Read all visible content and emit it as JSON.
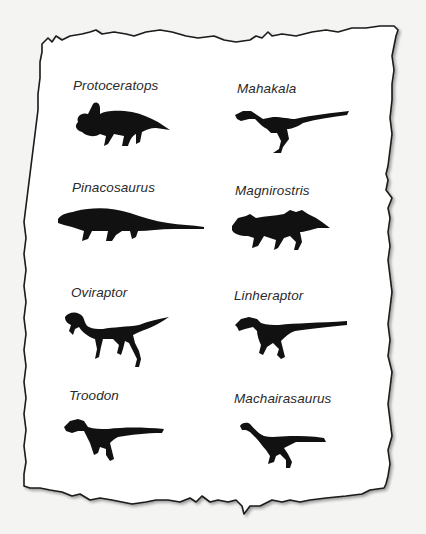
{
  "panel": {
    "background": "#f4f4f2",
    "paper_color": "#ffffff",
    "border_color": "#1a1a1a",
    "silhouette_color": "#111111"
  },
  "dinosaurs": [
    {
      "name": "Protoceratops",
      "icon": "protoceratops-silhouette-icon"
    },
    {
      "name": "Mahakala",
      "icon": "mahakala-silhouette-icon"
    },
    {
      "name": "Pinacosaurus",
      "icon": "pinacosaurus-silhouette-icon"
    },
    {
      "name": "Magnirostris",
      "icon": "magnirostris-silhouette-icon"
    },
    {
      "name": "Oviraptor",
      "icon": "oviraptor-silhouette-icon"
    },
    {
      "name": "Linheraptor",
      "icon": "linheraptor-silhouette-icon"
    },
    {
      "name": "Troodon",
      "icon": "troodon-silhouette-icon"
    },
    {
      "name": "Machairasaurus",
      "icon": "machairasaurus-silhouette-icon"
    }
  ]
}
